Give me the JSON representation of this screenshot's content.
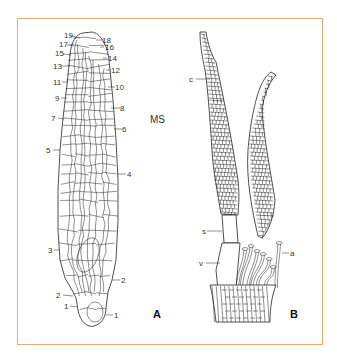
{
  "figure": {
    "panel_a": {
      "label": "A",
      "region_label": "MS",
      "cell_markers_left": [
        "19",
        "17",
        "15",
        "13",
        "11",
        "9",
        "7",
        "5",
        "3",
        "2",
        "1"
      ],
      "cell_markers_right": [
        "18",
        "16",
        "14",
        "12",
        "10",
        "8",
        "6",
        "4",
        "2",
        "1"
      ]
    },
    "panel_b": {
      "label": "B",
      "structure_labels": {
        "c": "c",
        "s": "s",
        "v": "v",
        "a": "a"
      }
    },
    "colors": {
      "frame": "#e8a878",
      "line": "#333333",
      "background": "#ffffff"
    }
  }
}
